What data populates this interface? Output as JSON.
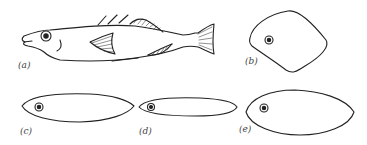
{
  "figure": {
    "panels": [
      {
        "id": "a",
        "label": "(a)",
        "description": "side view of stickleback-like fish"
      },
      {
        "id": "b",
        "label": "(b)",
        "description": "deep rounded-diamond body cross-section"
      },
      {
        "id": "c",
        "label": "(c)",
        "description": "fusiform elongated body outline"
      },
      {
        "id": "d",
        "label": "(d)",
        "description": "slender elongated body outline"
      },
      {
        "id": "e",
        "label": "(e)",
        "description": "deep oval body outline"
      }
    ],
    "colors": {
      "stroke": "#222222",
      "background": "#ffffff",
      "label": "#444444"
    }
  }
}
